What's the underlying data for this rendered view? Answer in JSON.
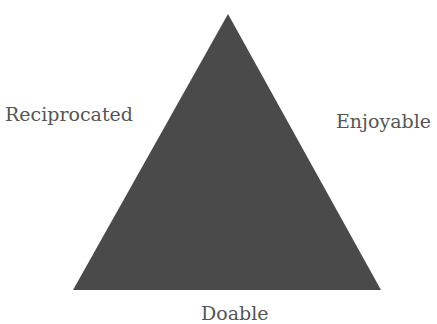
{
  "diagram": {
    "shape": "triangle",
    "fill_color": "#4a4a4a",
    "labels": {
      "left": "Reciprocated",
      "right": "Enjoyable",
      "bottom": "Doable"
    }
  }
}
